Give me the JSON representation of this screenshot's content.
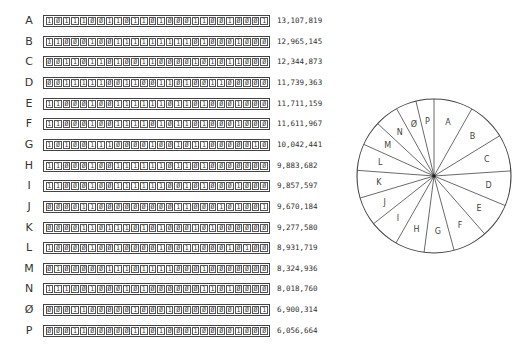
{
  "chart_data": {
    "type": "pie",
    "title": "",
    "categories": [
      "A",
      "B",
      "C",
      "D",
      "E",
      "F",
      "G",
      "H",
      "I",
      "J",
      "K",
      "L",
      "M",
      "N",
      "Ø",
      "P"
    ],
    "values": [
      13107819,
      12965145,
      12344873,
      11739363,
      11711159,
      11611967,
      10042441,
      9883682,
      9857597,
      9670184,
      9277580,
      8931719,
      8324936,
      8018760,
      6900314,
      6056664
    ],
    "value_labels": [
      "13,107,819",
      "12,965,145",
      "12,344,873",
      "11,739,363",
      "11,711,159",
      "11,611,967",
      "10,042,441",
      "9,883,682",
      "9,857,597",
      "9,670,184",
      "9,277,580",
      "8,931,719",
      "8,324,936",
      "8,018,760",
      "6,900,314",
      "6,056,664"
    ],
    "start_angle": "top, clockwise",
    "legend_position": "left (table of labels with binary strips and values)"
  },
  "rows": [
    {
      "label": "A",
      "bits": "10111001101101000110010001",
      "value": "13,107,819"
    },
    {
      "label": "B",
      "bits": "11000100111111111010001000",
      "value": "12,965,145"
    },
    {
      "label": "C",
      "bits": "00110110100110000101011000",
      "value": "12,344,873"
    },
    {
      "label": "D",
      "bits": "00111110011001101001100000",
      "value": "11,739,363"
    },
    {
      "label": "E",
      "bits": "11000100111111011010001000",
      "value": "11,711,159"
    },
    {
      "label": "F",
      "bits": "11000100111101011010001000",
      "value": "11,611,967"
    },
    {
      "label": "G",
      "bits": "10100111000010010110000010",
      "value": "10,042,441"
    },
    {
      "label": "H",
      "bits": "11000100111111011010000000",
      "value": "9,883,682"
    },
    {
      "label": "I",
      "bits": "11000100111111001010001000",
      "value": "9,857,597"
    },
    {
      "label": "J",
      "bits": "00001100000000011000101001",
      "value": "9,670,184"
    },
    {
      "label": "K",
      "bits": "00001101110101000101000000",
      "value": "9,277,580"
    },
    {
      "label": "L",
      "bits": "10000100100001001100010100",
      "value": "8,931,719"
    },
    {
      "label": "M",
      "bits": "01000001110111100010000000",
      "value": "8,324,936"
    },
    {
      "label": "N",
      "bits": "11100100010100000011010000",
      "value": "8,018,760"
    },
    {
      "label": "Ø",
      "bits": "00011000001000100000001001",
      "value": "6,900,314"
    },
    {
      "label": "P",
      "bits": "00011000001101000100001000",
      "value": "6,056,664"
    }
  ],
  "colors": {
    "line": "#444444",
    "text": "#333333",
    "background": "#ffffff"
  }
}
